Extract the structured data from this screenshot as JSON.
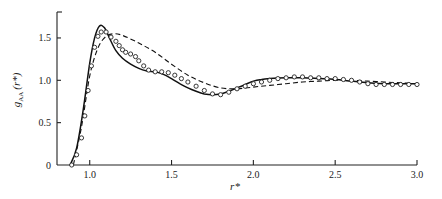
{
  "chart_data": {
    "type": "line",
    "title": "",
    "xlabel": "r*",
    "ylabel": "g_AA (r*)",
    "ylabel_main": "g",
    "ylabel_sub": "AA",
    "ylabel_arg": "(r*)",
    "xlim": [
      0.8,
      3.0
    ],
    "ylim": [
      0,
      1.75
    ],
    "x_ticks": [
      1.0,
      1.5,
      2.0,
      2.5,
      3.0
    ],
    "x_tick_labels": [
      "1.0",
      "1.5",
      "2.0",
      "2.5",
      "3.0"
    ],
    "y_ticks": [
      0,
      0.5,
      1.0,
      1.5
    ],
    "y_tick_labels": [
      "0",
      "0.5",
      "1.0",
      "1.5"
    ],
    "grid": false,
    "legend": null,
    "series": [
      {
        "name": "solid",
        "style": "solid",
        "x": [
          0.88,
          0.92,
          0.96,
          1.0,
          1.03,
          1.06,
          1.09,
          1.12,
          1.16,
          1.2,
          1.25,
          1.3,
          1.35,
          1.4,
          1.45,
          1.5,
          1.55,
          1.6,
          1.65,
          1.7,
          1.75,
          1.8,
          1.85,
          1.9,
          1.95,
          2.0,
          2.05,
          2.1,
          2.2,
          2.3,
          2.4,
          2.5,
          2.6,
          2.7,
          2.8,
          2.9,
          3.0
        ],
        "values": [
          0.0,
          0.2,
          0.65,
          1.2,
          1.5,
          1.64,
          1.62,
          1.5,
          1.35,
          1.26,
          1.19,
          1.14,
          1.11,
          1.1,
          1.07,
          1.02,
          0.96,
          0.91,
          0.87,
          0.84,
          0.83,
          0.84,
          0.87,
          0.91,
          0.95,
          0.99,
          1.01,
          1.02,
          1.03,
          1.03,
          1.02,
          1.01,
          0.99,
          0.97,
          0.96,
          0.96,
          0.96
        ]
      },
      {
        "name": "dashed",
        "style": "dashed",
        "x": [
          0.9,
          0.95,
          1.0,
          1.05,
          1.1,
          1.15,
          1.2,
          1.3,
          1.4,
          1.5,
          1.6,
          1.7,
          1.8,
          1.9,
          2.0,
          2.1,
          2.2,
          2.3,
          2.4,
          2.5,
          2.6,
          2.7,
          2.8,
          2.9,
          3.0
        ],
        "values": [
          0.0,
          0.45,
          1.05,
          1.38,
          1.52,
          1.55,
          1.53,
          1.44,
          1.33,
          1.19,
          1.06,
          0.97,
          0.91,
          0.9,
          0.92,
          0.94,
          0.96,
          0.98,
          0.99,
          1.0,
          1.0,
          0.99,
          0.98,
          0.97,
          0.96
        ]
      },
      {
        "name": "circles",
        "style": "markers",
        "x": [
          0.89,
          0.92,
          0.95,
          0.97,
          0.99,
          1.01,
          1.03,
          1.05,
          1.07,
          1.1,
          1.13,
          1.16,
          1.18,
          1.2,
          1.22,
          1.25,
          1.28,
          1.3,
          1.33,
          1.36,
          1.4,
          1.44,
          1.48,
          1.52,
          1.56,
          1.6,
          1.65,
          1.7,
          1.75,
          1.8,
          1.85,
          1.9,
          1.95,
          2.0,
          2.05,
          2.1,
          2.15,
          2.2,
          2.25,
          2.3,
          2.35,
          2.4,
          2.45,
          2.5,
          2.55,
          2.6,
          2.65,
          2.7,
          2.75,
          2.8,
          2.85,
          2.9,
          2.95,
          3.0
        ],
        "values": [
          0.0,
          0.12,
          0.32,
          0.58,
          0.88,
          1.17,
          1.39,
          1.52,
          1.57,
          1.57,
          1.51,
          1.46,
          1.41,
          1.36,
          1.33,
          1.31,
          1.28,
          1.23,
          1.17,
          1.12,
          1.1,
          1.1,
          1.09,
          1.06,
          1.02,
          0.98,
          0.93,
          0.88,
          0.84,
          0.83,
          0.86,
          0.9,
          0.93,
          0.96,
          0.98,
          1.0,
          1.02,
          1.03,
          1.04,
          1.04,
          1.03,
          1.03,
          1.02,
          1.02,
          1.01,
          1.0,
          0.98,
          0.96,
          0.95,
          0.95,
          0.95,
          0.95,
          0.95,
          0.95
        ]
      }
    ]
  },
  "plot_area": {
    "x0_px": 57,
    "x1_px": 417,
    "y0_px": 165,
    "ytop_px": 12,
    "x_min": 0.8,
    "x_max": 3.0,
    "y_min": 0,
    "y_per_px": 84.7
  }
}
